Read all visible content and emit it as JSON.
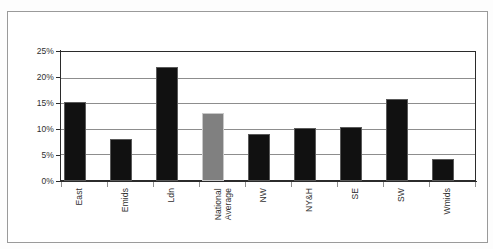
{
  "chart_data": {
    "type": "bar",
    "title": "",
    "subtitle": "",
    "xlabel": "",
    "ylabel": "",
    "categories": [
      "East",
      "Emids",
      "Ldn",
      "National Average",
      "NW",
      "NY&H",
      "SE",
      "SW",
      "Wmids"
    ],
    "values": [
      15.3,
      8.1,
      22.1,
      13.2,
      9.2,
      10.2,
      10.5,
      15.9,
      4.3
    ],
    "bar_colors": [
      "#111111",
      "#111111",
      "#111111",
      "#808080",
      "#111111",
      "#111111",
      "#111111",
      "#111111",
      "#111111"
    ],
    "highlight_category": "National Average",
    "ylim": [
      0,
      25
    ],
    "ytick_values": [
      0,
      5,
      10,
      15,
      20,
      25
    ],
    "ytick_labels": [
      "0%",
      "5%",
      "10%",
      "15%",
      "20%",
      "25%"
    ],
    "grid": true,
    "grid_axis": "y",
    "legend": false,
    "legend_position": "none",
    "value_labels_shown": false,
    "axis_color": "#2b2b2b",
    "grid_color": "#8d8d8d",
    "plot_background": "#ffffff",
    "figure_border_color": "#9a9a9a"
  },
  "x_axis_labels": [
    {
      "label": "East",
      "line1": "East",
      "line2": ""
    },
    {
      "label": "Emids",
      "line1": "Emids",
      "line2": ""
    },
    {
      "label": "Ldn",
      "line1": "Ldn",
      "line2": ""
    },
    {
      "label": "National Average",
      "line1": "National",
      "line2": "Average"
    },
    {
      "label": "NW",
      "line1": "NW",
      "line2": ""
    },
    {
      "label": "NY&H",
      "line1": "NY&H",
      "line2": ""
    },
    {
      "label": "SE",
      "line1": "SE",
      "line2": ""
    },
    {
      "label": "SW",
      "line1": "SW",
      "line2": ""
    },
    {
      "label": "Wmids",
      "line1": "Wmids",
      "line2": ""
    }
  ]
}
